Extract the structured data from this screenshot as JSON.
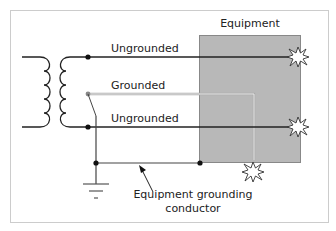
{
  "diagram": {
    "title": "Equipment",
    "conductors": [
      {
        "label": "Ungrounded",
        "type": "ungrounded",
        "color": "#222222"
      },
      {
        "label": "Grounded",
        "type": "grounded",
        "color": "#bbbbbb"
      },
      {
        "label": "Ungrounded",
        "type": "ungrounded",
        "color": "#222222"
      }
    ],
    "annotation": {
      "line1": "Equipment grounding",
      "line2": "conductor"
    },
    "icons": [
      "transformer-icon",
      "ground-symbol-icon",
      "fault-spark-icon"
    ],
    "colors": {
      "equipment_fill": "#b8b8b8",
      "equipment_border": "#888888",
      "wire": "#222222",
      "grounded_wire": "#c8c8c8",
      "frame": "#cccccc"
    }
  }
}
